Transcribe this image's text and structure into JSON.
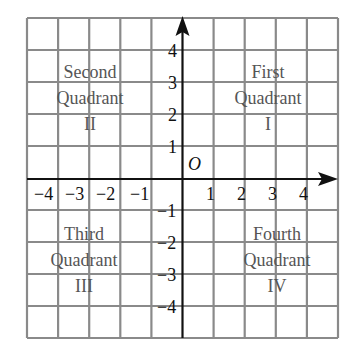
{
  "diagram": {
    "type": "coordinate-plane",
    "grid": {
      "columns": 10,
      "rows": 10,
      "x_range": [
        -5,
        5
      ],
      "y_range": [
        -5,
        5
      ]
    },
    "origin_label": "O",
    "x_ticks": [
      {
        "value": -4,
        "label": "−4"
      },
      {
        "value": -3,
        "label": "−3"
      },
      {
        "value": -2,
        "label": "−2"
      },
      {
        "value": -1,
        "label": "−1"
      },
      {
        "value": 1,
        "label": "1"
      },
      {
        "value": 2,
        "label": "2"
      },
      {
        "value": 3,
        "label": "3"
      },
      {
        "value": 4,
        "label": "4"
      }
    ],
    "y_ticks": [
      {
        "value": 4,
        "label": "4"
      },
      {
        "value": 3,
        "label": "3"
      },
      {
        "value": 2,
        "label": "2"
      },
      {
        "value": 1,
        "label": "1"
      },
      {
        "value": -1,
        "label": "−1"
      },
      {
        "value": -2,
        "label": "−2"
      },
      {
        "value": -3,
        "label": "−3"
      },
      {
        "value": -4,
        "label": "−4"
      }
    ],
    "quadrants": {
      "first": {
        "line1": "First",
        "line2": "Quadrant",
        "numeral": "I"
      },
      "second": {
        "line1": "Second",
        "line2": "Quadrant",
        "numeral": "II"
      },
      "third": {
        "line1": "Third",
        "line2": "Quadrant",
        "numeral": "III"
      },
      "fourth": {
        "line1": "Fourth",
        "line2": "Quadrant",
        "numeral": "IV"
      }
    },
    "colors": {
      "grid": "#8a8a8a",
      "axis": "#111111",
      "quadrant_text": "#555555"
    }
  }
}
